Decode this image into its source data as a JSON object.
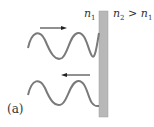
{
  "labels": {
    "n1_sym": "n",
    "n1_sub": "1",
    "n2_sym": "n",
    "n2_sub": "2",
    "gt": " > ",
    "n1b_sym": "n",
    "n1b_sub": "1",
    "panel": "(a)"
  },
  "colors": {
    "wave": "#777777",
    "slab": "#b8b8b8",
    "slab_edge": "#9a9a9a",
    "arrow": "#222222"
  },
  "diagram": {
    "incident_direction": "right",
    "reflected_direction": "left"
  }
}
